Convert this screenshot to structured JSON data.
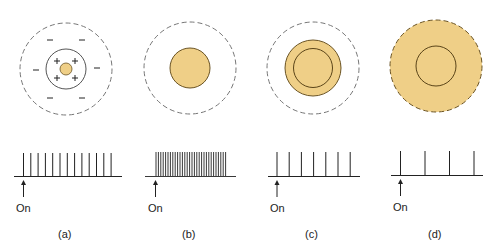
{
  "figure": {
    "colors": {
      "fill": "#EFCF87",
      "stroke_dark": "#6b5424",
      "dashed": "#777777",
      "line": "#222222"
    },
    "panels": [
      {
        "id": "a",
        "caption": "(a)",
        "on_label": "On",
        "receptive_field": {
          "type": "center-surround",
          "center_sign": "+",
          "surround_sign": "−",
          "stimulus": "small spot in center",
          "plus_signs": 4,
          "minus_signs": 6
        },
        "spike_count": 13
      },
      {
        "id": "b",
        "caption": "(b)",
        "on_label": "On",
        "receptive_field": {
          "type": "center-surround",
          "stimulus": "spot filling center"
        },
        "spike_count": 30
      },
      {
        "id": "c",
        "caption": "(c)",
        "on_label": "On",
        "receptive_field": {
          "type": "center-surround",
          "stimulus": "spot covering center and part of surround"
        },
        "spike_count": 7
      },
      {
        "id": "d",
        "caption": "(d)",
        "on_label": "On",
        "receptive_field": {
          "type": "center-surround",
          "stimulus": "spot covering entire receptive field"
        },
        "spike_count": 4
      }
    ]
  }
}
